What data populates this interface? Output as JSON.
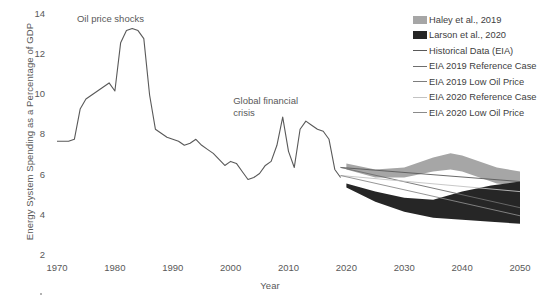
{
  "chart_data": {
    "type": "line",
    "title": "",
    "xlabel": "Year",
    "ylabel": "Energy System Spending as a Percentage of GDP",
    "xlim": [
      1970,
      2050
    ],
    "ylim": [
      2,
      14
    ],
    "xticks": [
      1970,
      1980,
      1990,
      2000,
      2010,
      2020,
      2030,
      2040,
      2050
    ],
    "yticks": [
      2,
      4,
      6,
      8,
      10,
      12,
      14
    ],
    "grid": false,
    "legend_position": "top-right",
    "annotations": [
      {
        "text": "Oil price shocks",
        "x": 1980,
        "y": 13.8
      },
      {
        "text": "Global financial",
        "x": 2007,
        "y": 9.7
      },
      {
        "text": "crisis",
        "x": 2007,
        "y": 9.1
      }
    ],
    "series": [
      {
        "name": "Historical Data (EIA)",
        "type": "line",
        "color": "#595959",
        "x": [
          1970,
          1971,
          1972,
          1973,
          1974,
          1975,
          1976,
          1977,
          1978,
          1979,
          1980,
          1981,
          1982,
          1983,
          1984,
          1985,
          1986,
          1987,
          1988,
          1989,
          1990,
          1991,
          1992,
          1993,
          1994,
          1995,
          1996,
          1997,
          1998,
          1999,
          2000,
          2001,
          2002,
          2003,
          2004,
          2005,
          2006,
          2007,
          2008,
          2009,
          2010,
          2011,
          2012,
          2013,
          2014,
          2015,
          2016,
          2017,
          2018,
          2019
        ],
        "y": [
          7.7,
          7.7,
          7.7,
          7.8,
          9.3,
          9.8,
          10.0,
          10.2,
          10.4,
          10.6,
          10.2,
          12.6,
          13.2,
          13.3,
          13.2,
          12.8,
          10.0,
          8.3,
          8.1,
          7.9,
          7.8,
          7.7,
          7.5,
          7.6,
          7.8,
          7.5,
          7.3,
          7.1,
          6.8,
          6.5,
          6.7,
          6.6,
          6.2,
          5.8,
          5.9,
          6.1,
          6.5,
          6.7,
          7.5,
          8.9,
          7.2,
          6.4,
          8.3,
          8.7,
          8.5,
          8.3,
          8.2,
          7.8,
          6.3,
          5.9
        ]
      },
      {
        "name": "EIA 2019 Reference Case",
        "type": "line",
        "color": "#595959",
        "x": [
          2019,
          2050
        ],
        "y": [
          6.4,
          5.7
        ]
      },
      {
        "name": "EIA 2019 Low Oil Price",
        "type": "line",
        "color": "#6e6e6e",
        "x": [
          2019,
          2050
        ],
        "y": [
          6.4,
          4.4
        ]
      },
      {
        "name": "EIA 2020 Reference Case",
        "type": "line",
        "color": "#c2c2c2",
        "x": [
          2019,
          2050
        ],
        "y": [
          6.0,
          5.2
        ]
      },
      {
        "name": "EIA 2020 Low Oil Price",
        "type": "line",
        "color": "#8a8a8a",
        "x": [
          2019,
          2050
        ],
        "y": [
          6.0,
          4.0
        ]
      },
      {
        "name": "Haley et al., 2019",
        "type": "band",
        "color": "#a6a6a6",
        "x": [
          2020,
          2025,
          2030,
          2035,
          2038,
          2040,
          2043,
          2046,
          2050
        ],
        "upper": [
          6.6,
          6.3,
          6.4,
          6.9,
          7.1,
          7.0,
          6.7,
          6.4,
          6.2
        ],
        "lower": [
          6.3,
          5.9,
          5.9,
          6.2,
          6.3,
          6.2,
          5.9,
          5.6,
          5.5
        ]
      },
      {
        "name": "Larson et al., 2020",
        "type": "band",
        "color": "#262626",
        "x": [
          2020,
          2025,
          2030,
          2035,
          2040,
          2045,
          2050
        ],
        "upper": [
          5.6,
          5.2,
          4.9,
          4.8,
          5.2,
          5.5,
          5.7
        ],
        "lower": [
          5.4,
          4.7,
          4.2,
          3.9,
          3.8,
          3.7,
          3.6
        ]
      }
    ]
  },
  "legend": {
    "items": [
      {
        "label": "Haley et al., 2019",
        "marker": "swatch",
        "color": "#a6a6a6"
      },
      {
        "label": "Larson et al., 2020",
        "marker": "swatch",
        "color": "#262626"
      },
      {
        "label": "Historical Data (EIA)",
        "marker": "line",
        "color": "#595959",
        "width": "1.6px"
      },
      {
        "label": "EIA 2019 Reference Case",
        "marker": "line",
        "color": "#6e6e6e",
        "width": "1.3px"
      },
      {
        "label": "EIA 2019 Low Oil Price",
        "marker": "line",
        "color": "#7d7d7d",
        "width": "1.2px"
      },
      {
        "label": "EIA 2020 Reference Case",
        "marker": "line",
        "color": "#c2c2c2",
        "width": "1.2px"
      },
      {
        "label": "EIA 2020 Low Oil Price",
        "marker": "line",
        "color": "#8a8a8a",
        "width": "1.2px"
      }
    ]
  }
}
